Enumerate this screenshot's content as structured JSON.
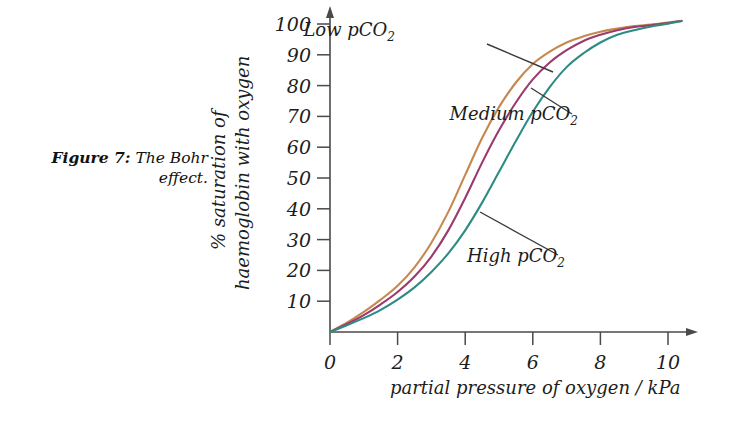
{
  "figure": {
    "caption_label": "Figure 7:",
    "caption_text": "The Bohr effect."
  },
  "chart_data": {
    "type": "line",
    "title": "",
    "subtitle": "",
    "xlabel": "partial pressure of oxygen / kPa",
    "ylabel_line1": "% saturation of",
    "ylabel_line2": "haemoglobin with oxygen",
    "xlim": [
      0,
      10.6
    ],
    "ylim": [
      0,
      104
    ],
    "xticks": [
      0,
      2,
      4,
      6,
      8,
      10
    ],
    "xtick_labels": [
      "0",
      "2",
      "4",
      "6",
      "8",
      "10"
    ],
    "yticks": [
      10,
      20,
      30,
      40,
      50,
      60,
      70,
      80,
      90,
      100
    ],
    "ytick_labels": [
      "10",
      "20",
      "30",
      "40",
      "50",
      "60",
      "70",
      "80",
      "90",
      "100"
    ],
    "grid": false,
    "legend_position": "inline-annotations",
    "axis_arrows": true,
    "x": [
      0,
      0.5,
      1,
      1.5,
      2,
      2.5,
      3,
      3.5,
      4,
      4.5,
      5,
      5.5,
      6,
      6.5,
      7,
      7.5,
      8,
      8.5,
      9,
      9.5,
      10,
      10.4
    ],
    "series": [
      {
        "name": "Low pCO2",
        "label": "Low pCO",
        "label_sub": "2",
        "color": "#c6884f",
        "values": [
          0,
          3,
          6.5,
          10.5,
          15,
          21,
          29,
          39,
          51,
          63,
          73,
          81,
          87,
          91,
          94,
          96,
          97.5,
          98.5,
          99.3,
          99.8,
          100.5,
          101
        ],
        "annotation": {
          "text_x": 395,
          "text_y": 36,
          "leader_from_x": 487,
          "leader_from_y": 44,
          "leader_to_x": 553,
          "leader_to_y": 72
        }
      },
      {
        "name": "Medium pCO2",
        "label": "Medium pCO",
        "label_sub": "2",
        "color": "#9c3a6e",
        "values": [
          0,
          2.6,
          5.5,
          9,
          13,
          18,
          24.5,
          33,
          43.5,
          55,
          65.5,
          74.5,
          82,
          87.5,
          91.5,
          94.5,
          96.5,
          98,
          99,
          99.6,
          100.3,
          101
        ],
        "annotation": {
          "text_x": 578,
          "text_y": 120,
          "leader_from_x": 572,
          "leader_from_y": 114,
          "leader_to_x": 531,
          "leader_to_y": 88
        }
      },
      {
        "name": "High pCO2",
        "label": "High pCO",
        "label_sub": "2",
        "color": "#2e8b84",
        "values": [
          0,
          2.2,
          4.5,
          7.2,
          10.5,
          14.5,
          19.5,
          25.5,
          33,
          42,
          52,
          62,
          71.5,
          79.5,
          86,
          90.5,
          94,
          96.5,
          98,
          99.2,
          100.1,
          101
        ],
        "annotation": {
          "text_x": 565,
          "text_y": 262,
          "leader_from_x": 558,
          "leader_from_y": 255,
          "leader_to_x": 480,
          "leader_to_y": 212
        }
      }
    ]
  }
}
